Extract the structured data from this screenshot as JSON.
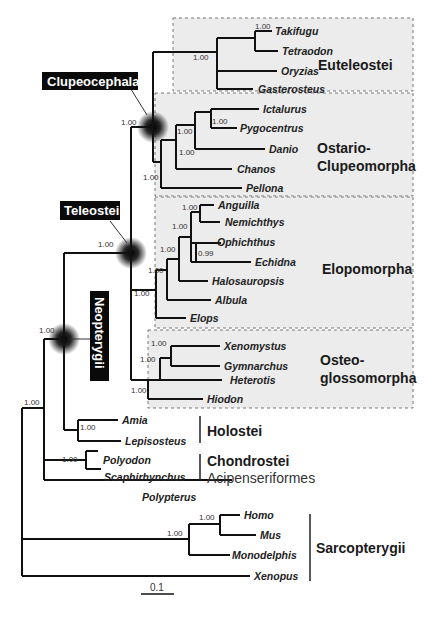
{
  "figure": {
    "type": "phylogenetic_tree",
    "scale_bar": "0.1",
    "highlighted_nodes": [
      "Clupeocephala",
      "Teleostei",
      "Neopterygii"
    ],
    "clade_groups": [
      {
        "name": "Euteleostei",
        "taxa": [
          "Takifugu",
          "Tetraodon",
          "Oryzias",
          "Gasterosteus"
        ]
      },
      {
        "name_line1": "Ostario-",
        "name_line2": "Clupeomorpha",
        "taxa": [
          "Ictalurus",
          "Pygocentrus",
          "Danio",
          "Chanos",
          "Pellona"
        ]
      },
      {
        "name": "Elopomorpha",
        "taxa": [
          "Anguilla",
          "Nemichthys",
          "Ophichthus",
          "Echidna",
          "Halosauropsis",
          "Albula",
          "Elops"
        ]
      },
      {
        "name_line1": "Osteo-",
        "name_line2": "glossomorpha",
        "taxa": [
          "Xenomystus",
          "Gymnarchus",
          "Heterotis",
          "Hiodon"
        ]
      },
      {
        "name": "Holostei",
        "taxa": [
          "Amia",
          "Lepisosteus"
        ]
      },
      {
        "name": "Chondrostei",
        "subname": "Acipenseriformes",
        "taxa": [
          "Polyodon",
          "Scaphirhynchus"
        ]
      },
      {
        "name": "Sarcopterygii",
        "taxa": [
          "Homo",
          "Mus",
          "Monodelphis",
          "Xenopus"
        ]
      }
    ],
    "outgroup_single": "Polypterus"
  },
  "labels": {
    "tags": {
      "clupeocephala": "Clupeocephala",
      "teleostei": "Teleostei",
      "neopterygii": "Neopterygii"
    },
    "clades": {
      "euteleostei": "Euteleostei",
      "ostario1": "Ostario-",
      "ostario2": "Clupeomorpha",
      "elopomorpha": "Elopomorpha",
      "osteo1": "Osteo-",
      "osteo2": "glossomorpha",
      "holostei": "Holostei",
      "chondrostei": "Chondrostei",
      "acipenseriformes": "Acipenseriformes",
      "sarcopterygii": "Sarcopterygii"
    },
    "taxa": {
      "takifugu": "Takifugu",
      "tetraodon": "Tetraodon",
      "oryzias": "Oryzias",
      "gasterosteus": "Gasterosteus",
      "ictalurus": "Ictalurus",
      "pygocentrus": "Pygocentrus",
      "danio": "Danio",
      "chanos": "Chanos",
      "pellona": "Pellona",
      "anguilla": "Anguilla",
      "nemichthys": "Nemichthys",
      "ophichthus": "Ophichthus",
      "echidna": "Echidna",
      "halosauropsis": "Halosauropsis",
      "albula": "Albula",
      "elops": "Elops",
      "xenomystus": "Xenomystus",
      "gymnarchus": "Gymnarchus",
      "heterotis": "Heterotis",
      "hiodon": "Hiodon",
      "amia": "Amia",
      "lepisosteus": "Lepisosteus",
      "polyodon": "Polyodon",
      "scaphirhynchus": "Scaphirhynchus",
      "polypterus": "Polypterus",
      "homo": "Homo",
      "mus": "Mus",
      "monodelphis": "Monodelphis",
      "xenopus": "Xenopus"
    },
    "support": {
      "s100": "1.00",
      "s099": "0.99"
    },
    "scale": "0.1"
  }
}
